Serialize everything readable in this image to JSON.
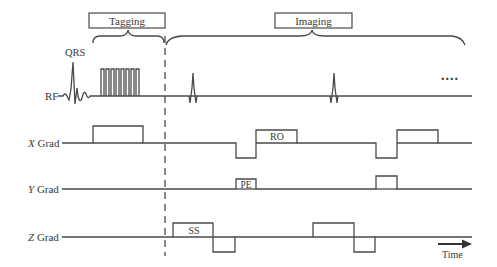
{
  "diagram": {
    "phases": [
      {
        "label": "Tagging"
      },
      {
        "label": "Imaging"
      }
    ],
    "ecg_label": "QRS",
    "rows": [
      {
        "label": "RF",
        "italic_prefix": ""
      },
      {
        "label": "X Grad",
        "italic_prefix": "X",
        "suffix": " Grad"
      },
      {
        "label": "Y Grad",
        "italic_prefix": "Y",
        "suffix": " Grad"
      },
      {
        "label": "Z Grad",
        "italic_prefix": "Z",
        "suffix": " Grad"
      }
    ],
    "gradient_labels": {
      "readout": "RO",
      "phase_encode": "PE",
      "slice_select": "SS"
    },
    "continuation": "....",
    "time_axis_label": "Time",
    "tagging_pulse_count": 8,
    "colors": {
      "line": "#4a4a4a",
      "text": "#3a3a3a",
      "background": "#ffffff"
    }
  }
}
